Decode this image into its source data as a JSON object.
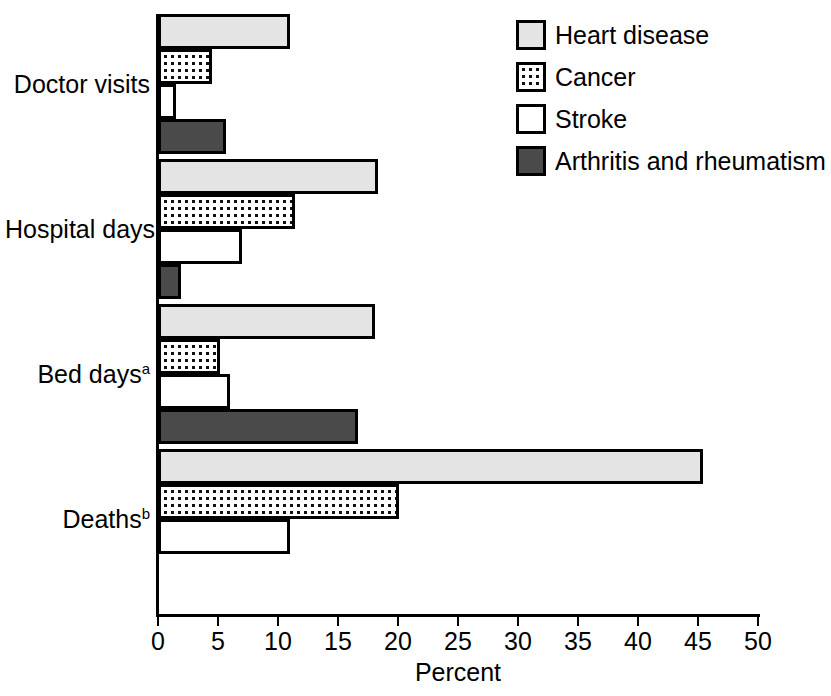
{
  "chart_data": {
    "type": "bar",
    "orientation": "horizontal",
    "title": "",
    "xlabel": "Percent",
    "ylabel": "",
    "xlim": [
      0,
      50
    ],
    "xticks": [
      0,
      5,
      10,
      15,
      20,
      25,
      30,
      35,
      40,
      45,
      50
    ],
    "grid": false,
    "legend_position": "top-right",
    "categories": [
      "Doctor visits",
      "Hospital days",
      "Bed days",
      "Deaths"
    ],
    "category_footnote_marks": [
      "",
      "",
      "a",
      "b"
    ],
    "series": [
      {
        "name": "Heart disease",
        "values": [
          11.0,
          18.3,
          18.1,
          45.4
        ],
        "color": "#e4e4e4",
        "pattern": "solid-light"
      },
      {
        "name": "Cancer",
        "values": [
          4.5,
          11.4,
          5.2,
          20.1
        ],
        "color": "#ffffff",
        "pattern": "dotted"
      },
      {
        "name": "Stroke",
        "values": [
          1.5,
          7.0,
          6.0,
          11.0
        ],
        "color": "#ffffff",
        "pattern": "open"
      },
      {
        "name": "Arthritis and rheumatism",
        "values": [
          5.7,
          1.9,
          16.7,
          0
        ],
        "color": "#4a4a4a",
        "pattern": "solid-dark"
      }
    ]
  },
  "axis": {
    "x_title": "Percent",
    "tick_labels": [
      "0",
      "5",
      "10",
      "15",
      "20",
      "25",
      "30",
      "35",
      "40",
      "45",
      "50"
    ]
  },
  "legend": {
    "items": [
      {
        "label": "Heart disease",
        "swatch": "light-gray"
      },
      {
        "label": "Cancer",
        "swatch": "dotted"
      },
      {
        "label": "Stroke",
        "swatch": "white"
      },
      {
        "label": "Arthritis and rheumatism",
        "swatch": "dark-gray"
      }
    ]
  },
  "categories": [
    {
      "label": "Doctor visits",
      "mark": ""
    },
    {
      "label": "Hospital days",
      "mark": ""
    },
    {
      "label": "Bed days",
      "mark": "a"
    },
    {
      "label": "Deaths",
      "mark": "b"
    }
  ]
}
